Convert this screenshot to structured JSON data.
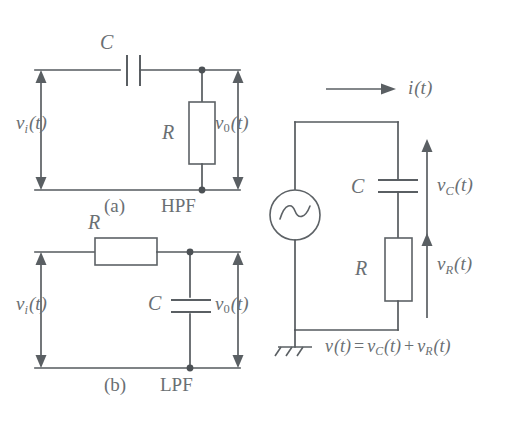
{
  "figure": {
    "background_color": "#ffffff",
    "ink_color": "#5d6266",
    "text_color": "#6a6f73"
  },
  "hpf": {
    "caption_index": "(a)",
    "caption_name": "HPF",
    "input_label": {
      "symbol": "v",
      "subscript": "i",
      "arg": "(t)"
    },
    "output_label": {
      "symbol": "v",
      "subscript": "0",
      "arg": "(t)"
    },
    "capacitor_label": "C",
    "resistor_label": "R"
  },
  "lpf": {
    "caption_index": "(b)",
    "caption_name": "LPF",
    "input_label": {
      "symbol": "v",
      "subscript": "i",
      "arg": "(t)"
    },
    "output_label": {
      "symbol": "v",
      "subscript": "0",
      "arg": "(t)"
    },
    "resistor_label": "R",
    "capacitor_label": "C"
  },
  "series_circuit": {
    "current_label": {
      "symbol": "i",
      "arg": "(t)"
    },
    "capacitor_label": "C",
    "resistor_label": "R",
    "cap_voltage_label": {
      "symbol": "v",
      "subscript": "C",
      "arg": "(t)"
    },
    "res_voltage_label": {
      "symbol": "v",
      "subscript": "R",
      "arg": "(t)"
    },
    "kvl_equation": {
      "lhs_symbol": "v",
      "lhs_arg": "(t)",
      "equals": "=",
      "term1_symbol": "v",
      "term1_sub": "C",
      "term1_arg": "(t)",
      "plus": "+",
      "term2_symbol": "v",
      "term2_sub": "R",
      "term2_arg": "(t)"
    },
    "source_type": "ac-sine-source",
    "ground": "earth-ground"
  }
}
